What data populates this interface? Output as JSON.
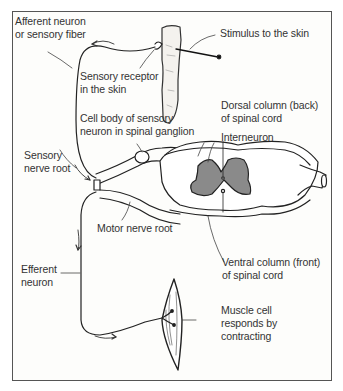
{
  "diagram": {
    "type": "reflex-arc",
    "colors": {
      "line": "#222222",
      "gray_matter": "#8a8a8a",
      "frame": "#555555",
      "text": "#333333"
    },
    "labels": {
      "afferent": [
        "Afferent neuron",
        "or sensory fiber"
      ],
      "stimulus": [
        "Stimulus to the skin"
      ],
      "receptor": [
        "Sensory receptor",
        "in the skin"
      ],
      "cell_body": [
        "Cell body of sensory",
        "neuron in spinal ganglion"
      ],
      "dorsal": [
        "Dorsal column (back)",
        "of spinal cord"
      ],
      "interneuron": [
        "Interneuron"
      ],
      "sensory_root": [
        "Sensory",
        "nerve root"
      ],
      "motor_root": [
        "Motor nerve root"
      ],
      "ventral": [
        "Ventral column (front)",
        "of spinal cord"
      ],
      "efferent": [
        "Efferent",
        "neuron"
      ],
      "muscle": [
        "Muscle cell",
        "responds by",
        "contracting"
      ]
    }
  }
}
